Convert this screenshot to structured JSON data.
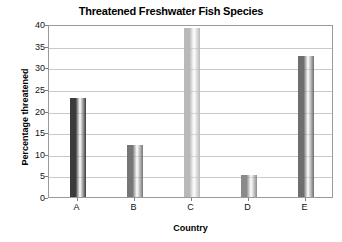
{
  "chart_data": {
    "type": "bar",
    "title": "Threatened Freshwater Fish Species",
    "xlabel": "Country",
    "ylabel": "Percentage threatened",
    "categories": [
      "A",
      "B",
      "C",
      "D",
      "E"
    ],
    "values": [
      23,
      12,
      39,
      5,
      32.5
    ],
    "ylim": [
      0,
      40
    ],
    "ytick_labels": [
      "0",
      "5",
      "10",
      "15",
      "20",
      "25",
      "30",
      "35",
      "40"
    ],
    "ytick_values": [
      0,
      5,
      10,
      15,
      20,
      25,
      30,
      35,
      40
    ],
    "grid": "horizontal",
    "legend": "none",
    "bar_colors": [
      "#3b3b3b",
      "#767676",
      "#b9b9b9",
      "#8a8a8a",
      "#6e6e6e"
    ],
    "axis_color": "#9a9a9a",
    "gridline_color": "#c9c9c9",
    "background_color": "#ffffff"
  }
}
